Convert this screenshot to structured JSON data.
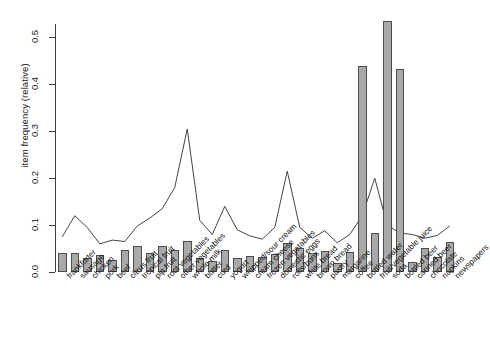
{
  "chart_data": {
    "type": "bar",
    "title": "",
    "xlabel": "",
    "ylabel": "item frequency (relative)",
    "ylim": [
      0.0,
      0.55
    ],
    "yticks": [
      0.0,
      0.1,
      0.2,
      0.3,
      0.4,
      0.5
    ],
    "ytick_labels": [
      "0.0",
      "0.1",
      "0.2",
      "0.3",
      "0.4",
      "0.5"
    ],
    "grid": false,
    "legend": "none",
    "bar_color": "#a9a9a9",
    "bar_border_color": "#4d4d4d",
    "line_color": "#444444",
    "categories": [
      "frankfurter",
      "sausage",
      "chicken",
      "pork",
      "beef",
      "citrus fruit",
      "tropical fruit",
      "pip fruit",
      "root vegetables",
      "other vegetables",
      "whole milk",
      "butter",
      "curd",
      "yogurt",
      "whipped/sour cream",
      "cream cheese",
      "frozen vegetables",
      "domestic eggs",
      "rolls/buns",
      "white bread",
      "brown bread",
      "pastry",
      "margarine",
      "coffee",
      "bottled water",
      "fruit/vegetable juice",
      "soda",
      "bottled beer",
      "canned beer",
      "chocolate",
      "napkins",
      "newspapers"
    ],
    "series": [
      {
        "name": "bars",
        "render": "bar",
        "values": [
          0.04,
          0.04,
          0.03,
          0.036,
          0.026,
          0.046,
          0.056,
          0.04,
          0.055,
          0.047,
          0.066,
          0.03,
          0.024,
          0.046,
          0.03,
          0.035,
          0.032,
          0.039,
          0.061,
          0.052,
          0.04,
          0.045,
          0.02,
          0.043,
          0.44,
          0.084,
          0.535,
          0.432,
          0.022,
          0.052,
          0.032,
          0.063
        ]
      },
      {
        "name": "line",
        "render": "line",
        "values": [
          0.075,
          0.12,
          0.095,
          0.06,
          0.068,
          0.065,
          0.098,
          0.115,
          0.135,
          0.18,
          0.305,
          0.11,
          0.08,
          0.14,
          0.09,
          0.077,
          0.07,
          0.095,
          0.215,
          0.095,
          0.072,
          0.088,
          0.062,
          0.08,
          0.12,
          0.2,
          0.1,
          0.083,
          0.08,
          0.072,
          0.078,
          0.098
        ]
      }
    ]
  }
}
